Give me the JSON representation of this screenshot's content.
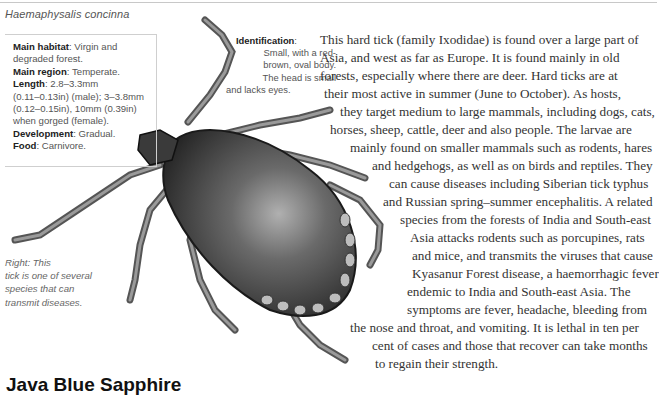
{
  "header": {
    "species_name": "Haemaphysalis concinna"
  },
  "fact_box": {
    "items": [
      {
        "label": "Main habitat",
        "value": ": Virgin and degraded forest."
      },
      {
        "label": "Main region",
        "value": ": Temperate."
      },
      {
        "label": "Length",
        "value": ": 2.8–3.3mm (0.11–0.13in) (male); 3–3.8mm (0.12–0.15in), 10mm (0.39in) when gorged (female)."
      },
      {
        "label": "Development",
        "value": ": Gradual."
      },
      {
        "label": "Food",
        "value": ": Carnivore."
      }
    ],
    "lines": [
      {
        "bold": "Main habitat",
        "rest": ": Virgin and"
      },
      {
        "bold": "",
        "rest": "degraded forest."
      },
      {
        "bold": "Main region",
        "rest": ": Temperate."
      },
      {
        "bold": "Length",
        "rest": ": 2.8–3.3mm"
      },
      {
        "bold": "",
        "rest": "(0.11–0.13in) (male); 3–3.8mm"
      },
      {
        "bold": "",
        "rest": "(0.12–0.15in), 10mm (0.39in)"
      },
      {
        "bold": "",
        "rest": "when gorged (female)."
      },
      {
        "bold": "Development",
        "rest": ": Gradual."
      },
      {
        "bold": "Food",
        "rest": ": Carnivore."
      }
    ]
  },
  "identification": {
    "label": "Identification",
    "lines": [
      ":",
      "Small, with a red-",
      "brown, oval body.",
      "The head is small",
      "and lacks eyes."
    ]
  },
  "caption": {
    "lines": [
      "Right: This",
      "tick is one of several",
      "species that can",
      "transmit diseases."
    ]
  },
  "body": {
    "lines": [
      {
        "x": 320,
        "y": 32,
        "text": "This hard tick (family Ixodidae) is found over a large part of"
      },
      {
        "x": 320,
        "y": 50,
        "text": "Asia, and west as far as Europe. It is found mainly in old"
      },
      {
        "x": 320,
        "y": 68,
        "text": "forests, especially where there are deer. Hard ticks are at"
      },
      {
        "x": 324,
        "y": 86,
        "text": "their most active in summer (June to October). As hosts,"
      },
      {
        "x": 340,
        "y": 104,
        "text": "they target medium to large mammals, including dogs, cats,"
      },
      {
        "x": 330,
        "y": 122,
        "text": "horses, sheep, cattle, deer and also people. The larvae are"
      },
      {
        "x": 350,
        "y": 140,
        "text": "mainly found on smaller mammals such as rodents, hares"
      },
      {
        "x": 372,
        "y": 158,
        "text": "and hedgehogs, as well as on birds and reptiles. They"
      },
      {
        "x": 389,
        "y": 176,
        "text": "can cause diseases including Siberian tick typhus"
      },
      {
        "x": 383,
        "y": 194,
        "text": "and Russian spring–summer encephalitis. A related"
      },
      {
        "x": 400,
        "y": 212,
        "text": "species from the forests of India and South-east"
      },
      {
        "x": 410,
        "y": 230,
        "text": "Asia attacks rodents such as porcupines, rats"
      },
      {
        "x": 412,
        "y": 248,
        "text": "and mice, and transmits the viruses that cause"
      },
      {
        "x": 412,
        "y": 266,
        "text": "Kyasanur Forest disease, a haemorrhagic fever"
      },
      {
        "x": 407,
        "y": 284,
        "text": "endemic to India and South-east Asia. The"
      },
      {
        "x": 407,
        "y": 302,
        "text": "symptoms are fever, headache, bleeding from"
      },
      {
        "x": 350,
        "y": 320,
        "text": "the nose and throat, and vomiting. It is lethal in ten per"
      },
      {
        "x": 372,
        "y": 338,
        "text": "cent of cases and those that recover can take months"
      },
      {
        "x": 375,
        "y": 356,
        "text": "to regain their strength."
      }
    ]
  },
  "bottom": {
    "heading": "Java Blue Sapphire"
  },
  "image": {
    "subject": "tick-illustration",
    "colors": {
      "body_dark": "#2a2a2a",
      "body_light": "#9a9a9a",
      "legs": "#7a7a7a"
    }
  }
}
